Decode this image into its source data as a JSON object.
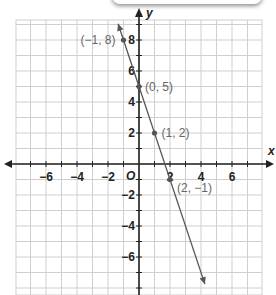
{
  "chart_data": {
    "type": "line",
    "title": "",
    "xlabel": "x",
    "ylabel": "y",
    "origin_label": "O",
    "xlim": [
      -8,
      8
    ],
    "ylim": [
      -8,
      9
    ],
    "grid": true,
    "x_ticks": [
      -6,
      -4,
      -2,
      2,
      4,
      6
    ],
    "y_ticks": [
      8,
      6,
      4,
      2,
      -2,
      -4,
      -6
    ],
    "x_tick_labels": [
      "−6",
      "−4",
      "−2",
      "2",
      "4",
      "6"
    ],
    "y_tick_labels": [
      "8",
      "6",
      "4",
      "2",
      "−2",
      "−4",
      "−6"
    ],
    "series": [
      {
        "name": "y = −3x + 5",
        "slope": -3,
        "intercept": 5,
        "points": [
          {
            "x": -1,
            "y": 8,
            "label": "(−1, 8)"
          },
          {
            "x": 0,
            "y": 5,
            "label": "(0, 5)"
          },
          {
            "x": 1,
            "y": 2,
            "label": "(1, 2)"
          },
          {
            "x": 2,
            "y": -1,
            "label": "(2, −1)"
          }
        ],
        "color": "#555555"
      }
    ],
    "legend": "none"
  },
  "colors": {
    "grid": "#cfcfcf",
    "axis": "#222222",
    "line": "#555555",
    "point": "#555555"
  }
}
